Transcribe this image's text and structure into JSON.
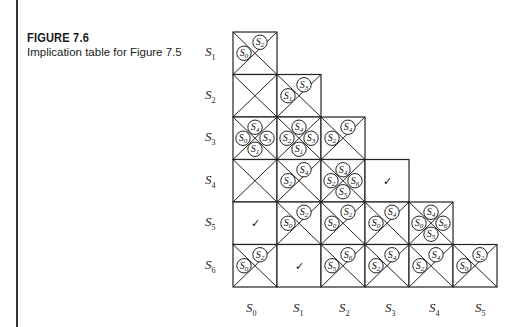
{
  "figure": {
    "title": "FIGURE 7.6",
    "caption": "Implication table for Figure 7.5"
  },
  "row_labels": [
    {
      "base": "S",
      "sub": "1"
    },
    {
      "base": "S",
      "sub": "2"
    },
    {
      "base": "S",
      "sub": "3"
    },
    {
      "base": "S",
      "sub": "4"
    },
    {
      "base": "S",
      "sub": "5"
    },
    {
      "base": "S",
      "sub": "6"
    }
  ],
  "col_labels": [
    {
      "base": "S",
      "sub": "0"
    },
    {
      "base": "S",
      "sub": "1"
    },
    {
      "base": "S",
      "sub": "2"
    },
    {
      "base": "S",
      "sub": "3"
    },
    {
      "base": "S",
      "sub": "4"
    },
    {
      "base": "S",
      "sub": "5"
    }
  ],
  "cells": [
    {
      "row": "S1",
      "col": "S0",
      "status": "implied",
      "pairs": [
        [
          "S2",
          "S0"
        ]
      ]
    },
    {
      "row": "S2",
      "col": "S0",
      "status": "crossed",
      "pairs": []
    },
    {
      "row": "S2",
      "col": "S1",
      "status": "implied",
      "pairs": [
        [
          "S3",
          "S1"
        ]
      ]
    },
    {
      "row": "S3",
      "col": "S0",
      "status": "implied",
      "pairs": [
        [
          "S4",
          "S1"
        ],
        [
          "S0",
          "S3"
        ]
      ]
    },
    {
      "row": "S3",
      "col": "S1",
      "status": "implied",
      "pairs": [
        [
          "S4",
          "S1"
        ],
        [
          "S2",
          "S3"
        ]
      ]
    },
    {
      "row": "S3",
      "col": "S2",
      "status": "implied",
      "pairs": [
        [
          "S4",
          "S2"
        ]
      ]
    },
    {
      "row": "S4",
      "col": "S0",
      "status": "crossed",
      "pairs": []
    },
    {
      "row": "S4",
      "col": "S1",
      "status": "implied",
      "pairs": [
        [
          "S4",
          "S2"
        ]
      ]
    },
    {
      "row": "S4",
      "col": "S2",
      "status": "implied",
      "pairs": [
        [
          "S4",
          "S5"
        ],
        [
          "S2",
          "S6"
        ]
      ]
    },
    {
      "row": "S4",
      "col": "S3",
      "status": "equivalent",
      "pairs": []
    },
    {
      "row": "S5",
      "col": "S0",
      "status": "equivalent",
      "pairs": []
    },
    {
      "row": "S5",
      "col": "S1",
      "status": "implied",
      "pairs": [
        [
          "S2",
          "S0"
        ]
      ]
    },
    {
      "row": "S5",
      "col": "S2",
      "status": "implied",
      "pairs": [
        [
          "S2",
          "S0"
        ]
      ]
    },
    {
      "row": "S5",
      "col": "S3",
      "status": "implied",
      "pairs": [
        [
          "S4",
          "S0"
        ]
      ]
    },
    {
      "row": "S5",
      "col": "S4",
      "status": "implied",
      "pairs": [
        [
          "S4",
          "S5"
        ],
        [
          "S0",
          "S6"
        ]
      ]
    },
    {
      "row": "S6",
      "col": "S0",
      "status": "implied",
      "pairs": [
        [
          "S2",
          "S0"
        ]
      ]
    },
    {
      "row": "S6",
      "col": "S1",
      "status": "equivalent",
      "pairs": []
    },
    {
      "row": "S6",
      "col": "S2",
      "status": "implied",
      "pairs": [
        [
          "S6",
          "S5"
        ]
      ]
    },
    {
      "row": "S6",
      "col": "S3",
      "status": "implied",
      "pairs": [
        [
          "S4",
          "S2"
        ]
      ]
    },
    {
      "row": "S6",
      "col": "S4",
      "status": "implied",
      "pairs": [
        [
          "S4",
          "S2"
        ]
      ]
    },
    {
      "row": "S6",
      "col": "S5",
      "status": "implied",
      "pairs": [
        [
          "S2",
          "S0"
        ]
      ]
    }
  ],
  "symbols": {
    "equivalent": "✓"
  }
}
